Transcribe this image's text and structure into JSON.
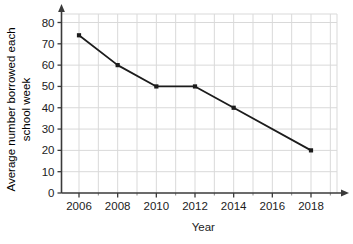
{
  "chart_data": {
    "type": "line",
    "title": "",
    "xlabel": "Year",
    "ylabel": "Average number borrowed each school week",
    "ylabel_lines": [
      "Average number borrowed each",
      "school week"
    ],
    "x": [
      2006,
      2008,
      2010,
      2012,
      2014,
      2018
    ],
    "values": [
      74,
      60,
      50,
      50,
      40,
      20
    ],
    "points": [
      {
        "x": 2006,
        "y": 74,
        "marker": true
      },
      {
        "x": 2008,
        "y": 60,
        "marker": true
      },
      {
        "x": 2010,
        "y": 50,
        "marker": true
      },
      {
        "x": 2012,
        "y": 50,
        "marker": true
      },
      {
        "x": 2014,
        "y": 40,
        "marker": true
      },
      {
        "x": 2018,
        "y": 20,
        "marker": true
      }
    ],
    "xlim": [
      2005,
      2019
    ],
    "ylim": [
      0,
      85
    ],
    "xticks": [
      2006,
      2008,
      2010,
      2012,
      2014,
      2016,
      2018
    ],
    "xtick_labels": [
      "2006",
      "2008",
      "2010",
      "2012",
      "2014",
      "2016",
      "2018"
    ],
    "x_minor_ticks": [
      2005,
      2007,
      2009,
      2011,
      2013,
      2015,
      2017,
      2019
    ],
    "yticks": [
      0,
      10,
      20,
      30,
      40,
      50,
      60,
      70,
      80
    ],
    "ytick_labels": [
      "0",
      "10",
      "20",
      "30",
      "40",
      "50",
      "60",
      "70",
      "80"
    ],
    "grid": true,
    "grid_color": "#d9d9d9",
    "legend": "none",
    "line_color": "#1c1c1c",
    "marker_color": "#1c1c1c",
    "marker_shape": "square",
    "axis_color": "#3a3a3a",
    "background": "#ffffff",
    "x_axis_arrow": true,
    "y_axis_arrow": true
  }
}
